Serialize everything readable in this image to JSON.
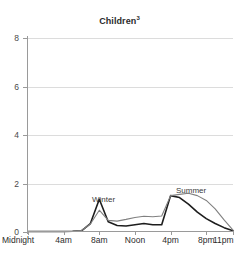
{
  "chart_data": {
    "type": "line",
    "title": "Children",
    "title_superscript": "3",
    "title_full": "Children³",
    "xlabel": "",
    "ylabel": "",
    "ylim": [
      0,
      8
    ],
    "yticks": [
      0,
      2,
      4,
      6,
      8
    ],
    "ytick_labels": [
      "0",
      "2",
      "4",
      "6",
      "8"
    ],
    "xlim": [
      0,
      23
    ],
    "xticks": [
      0,
      4,
      8,
      12,
      16,
      20,
      23
    ],
    "xtick_labels": [
      "Midnight",
      "4am",
      "8am",
      "Noon",
      "4pm",
      "8pm",
      "11pm"
    ],
    "grid": "horizontal",
    "legend_position": "inline-annotations",
    "x": [
      0,
      1,
      2,
      3,
      4,
      5,
      6,
      7,
      8,
      9,
      10,
      11,
      12,
      13,
      14,
      15,
      16,
      17,
      18,
      19,
      20,
      21,
      22,
      23
    ],
    "series": [
      {
        "name": "Winter",
        "color": "#1d1d1d",
        "label_x": 9,
        "label_y": 1.45,
        "values": [
          0.02,
          0.02,
          0.02,
          0.02,
          0.02,
          0.03,
          0.05,
          0.35,
          1.35,
          0.42,
          0.27,
          0.25,
          0.3,
          0.35,
          0.3,
          0.3,
          1.5,
          1.42,
          1.15,
          0.82,
          0.55,
          0.35,
          0.18,
          0.05
        ]
      },
      {
        "name": "Summer",
        "color": "#808080",
        "label_x": 19.5,
        "label_y": 1.85,
        "values": [
          0.02,
          0.02,
          0.02,
          0.02,
          0.02,
          0.03,
          0.06,
          0.33,
          0.9,
          0.48,
          0.45,
          0.52,
          0.6,
          0.65,
          0.63,
          0.66,
          1.5,
          1.55,
          1.6,
          1.5,
          1.3,
          0.95,
          0.5,
          0.08
        ]
      }
    ],
    "annotations": [
      {
        "text": "Winter",
        "series": "Winter"
      },
      {
        "text": "Summer",
        "series": "Summer"
      }
    ]
  },
  "colors": {
    "winter_line": "#1d1d1d",
    "summer_line": "#808080",
    "grid": "#dcdcdc",
    "axis": "#9a9a9a",
    "text": "#2b2b2b",
    "background": "#ffffff"
  }
}
